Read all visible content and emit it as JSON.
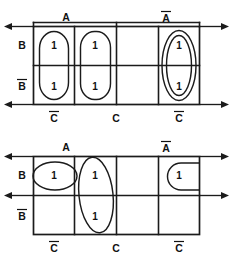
{
  "diagram": {
    "ink_color": "#1b1b1b",
    "background_color": "#ffffff"
  },
  "maps": [
    {
      "id": "map-top",
      "position": "top",
      "column_labels_top": [
        {
          "text": "A",
          "overbar": false,
          "spans_columns": [
            1,
            2
          ]
        },
        {
          "text": "A",
          "overbar": true,
          "spans_columns": [
            3,
            4
          ]
        }
      ],
      "row_labels_left": [
        {
          "text": "B",
          "overbar": false,
          "row": 1
        },
        {
          "text": "B",
          "overbar": true,
          "row": 2
        }
      ],
      "column_labels_bottom": [
        {
          "text": "C",
          "overbar": true,
          "spans_columns": [
            1
          ]
        },
        {
          "text": "C",
          "overbar": false,
          "spans_columns": [
            2,
            3
          ]
        },
        {
          "text": "C",
          "overbar": true,
          "spans_columns": [
            4
          ]
        }
      ],
      "cells": [
        {
          "row": 1,
          "col": 1,
          "value": "1"
        },
        {
          "row": 1,
          "col": 2,
          "value": "1"
        },
        {
          "row": 1,
          "col": 3,
          "value": ""
        },
        {
          "row": 1,
          "col": 4,
          "value": "1"
        },
        {
          "row": 2,
          "col": 1,
          "value": "1"
        },
        {
          "row": 2,
          "col": 2,
          "value": "1"
        },
        {
          "row": 2,
          "col": 3,
          "value": ""
        },
        {
          "row": 2,
          "col": 4,
          "value": "1"
        }
      ],
      "groups": [
        {
          "name": "group-col1-both-rows",
          "shape": "rounded-rect",
          "covers": "col 1, rows 1-2"
        },
        {
          "name": "group-col2-both-rows",
          "shape": "rounded-rect",
          "covers": "col 2, rows 1-2"
        },
        {
          "name": "group-col4-outer-oval",
          "shape": "oval",
          "covers": "col 4, rows 1-2"
        },
        {
          "name": "group-col4-inner-oval",
          "shape": "oval",
          "covers": "col 4, rows 1-2"
        }
      ],
      "arrows": [
        {
          "name": "arrow-left-top",
          "side": "left",
          "direction": "left",
          "row_edge": "top"
        },
        {
          "name": "arrow-left-bottom",
          "side": "left",
          "direction": "left",
          "row_edge": "bottom"
        },
        {
          "name": "arrow-right-top",
          "side": "right",
          "direction": "right",
          "row_edge": "top"
        },
        {
          "name": "arrow-right-bottom",
          "side": "right",
          "direction": "right",
          "row_edge": "bottom"
        }
      ]
    },
    {
      "id": "map-bottom",
      "position": "bottom",
      "column_labels_top": [
        {
          "text": "A",
          "overbar": false,
          "spans_columns": [
            1,
            2
          ]
        },
        {
          "text": "A",
          "overbar": true,
          "spans_columns": [
            3,
            4
          ]
        }
      ],
      "row_labels_left": [
        {
          "text": "B",
          "overbar": false,
          "row": 1
        },
        {
          "text": "B",
          "overbar": true,
          "row": 2
        }
      ],
      "column_labels_bottom": [
        {
          "text": "C",
          "overbar": true,
          "spans_columns": [
            1
          ]
        },
        {
          "text": "C",
          "overbar": false,
          "spans_columns": [
            2,
            3
          ]
        },
        {
          "text": "C",
          "overbar": true,
          "spans_columns": [
            4
          ]
        }
      ],
      "cells": [
        {
          "row": 1,
          "col": 1,
          "value": "1"
        },
        {
          "row": 1,
          "col": 2,
          "value": "1"
        },
        {
          "row": 1,
          "col": 3,
          "value": ""
        },
        {
          "row": 1,
          "col": 4,
          "value": "1"
        },
        {
          "row": 2,
          "col": 1,
          "value": ""
        },
        {
          "row": 2,
          "col": 2,
          "value": "1"
        },
        {
          "row": 2,
          "col": 3,
          "value": ""
        },
        {
          "row": 2,
          "col": 4,
          "value": ""
        }
      ],
      "groups": [
        {
          "name": "group-horizontal-oval-col1",
          "shape": "oval",
          "covers": "col 1, row 1"
        },
        {
          "name": "group-vertical-oval-col2",
          "shape": "oval",
          "covers": "col 2, rows 1-2"
        },
        {
          "name": "group-dshape-col4",
          "shape": "d-shape",
          "covers": "col 4, row 1"
        }
      ],
      "arrows": [
        {
          "name": "arrow-left-top",
          "side": "left",
          "direction": "left",
          "row_edge": "top"
        },
        {
          "name": "arrow-left-bottom",
          "side": "left",
          "direction": "left",
          "row_edge": "bottom"
        },
        {
          "name": "arrow-right-top",
          "side": "right",
          "direction": "right",
          "row_edge": "top"
        },
        {
          "name": "arrow-right-bottom",
          "side": "right",
          "direction": "right",
          "row_edge": "bottom"
        }
      ]
    }
  ],
  "labels": {
    "A": "A",
    "A_bar": "A",
    "B": "B",
    "B_bar": "B",
    "C": "C",
    "C_bar": "C",
    "one": "1"
  }
}
